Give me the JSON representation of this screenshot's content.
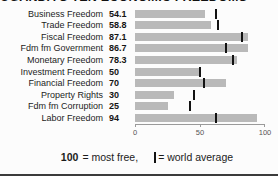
{
  "title": "UGANDA'S TEN ECONOMIC FREEDOMS",
  "chart_data": {
    "type": "bar",
    "orientation": "horizontal",
    "title": "UGANDA'S TEN ECONOMIC FREEDOMS",
    "categories": [
      "Business Freedom",
      "Trade Freedom",
      "Fiscal Freedom",
      "Fdm fm Government",
      "Monetary Freedom",
      "Investment Freedom",
      "Financial Freedom",
      "Property Rights",
      "Fdm fm Corruption",
      "Labor Freedom"
    ],
    "values": [
      54.1,
      58.8,
      87.1,
      86.7,
      78.3,
      50,
      70,
      30,
      25,
      94
    ],
    "value_labels": [
      "54.1",
      "58.8",
      "87.1",
      "86.7",
      "78.3",
      "50",
      "70",
      "30",
      "25",
      "94"
    ],
    "world_average_markers": [
      62,
      64,
      82,
      70,
      75,
      50,
      53,
      45,
      42,
      62
    ],
    "xlim": [
      0,
      100
    ],
    "x_ticks": [
      0,
      50,
      100
    ],
    "x_tick_labels": [
      "0",
      "50",
      "100"
    ],
    "bar_color": "#b9b9b9",
    "marker_color": "#121212",
    "grid": false,
    "legend": "100 = most free, | = world average"
  },
  "footer": {
    "bold_value": "100",
    "text_1": "= most free,",
    "marker_glyph": "|",
    "text_2": "= world average"
  }
}
